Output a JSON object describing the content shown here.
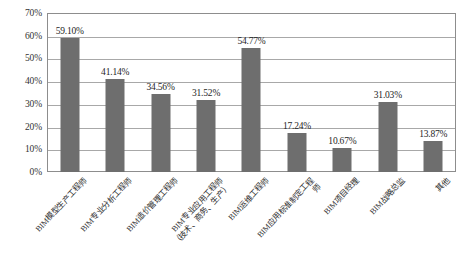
{
  "chart_data": {
    "type": "bar",
    "title": "",
    "subtitle": "",
    "xlabel": "",
    "ylabel": "",
    "ylim": [
      0,
      70
    ],
    "ytick_step": 10,
    "grid": true,
    "legend": false,
    "legend_position": "none",
    "value_unit": "%",
    "bar_color": "#6e6e6e",
    "frame_color": "#8d8d8d",
    "gridline_color": "#a8a8a8",
    "categories": [
      "BIM模型生产工程师",
      "BIM专业分析工程师",
      "BIM造价管理工程师",
      "BIM专业应用工程师（技术、商务、生产）",
      "BIM运维工程师",
      "BIM应用标准制定工程师",
      "BIM项目经理",
      "BIM战略总监",
      "其他"
    ],
    "values": [
      59.1,
      41.14,
      34.56,
      31.52,
      54.77,
      17.24,
      10.67,
      31.03,
      13.87
    ],
    "value_labels": [
      "59.10%",
      "41.14%",
      "34.56%",
      "31.52%",
      "54.77%",
      "17.24%",
      "10.67%",
      "31.03%",
      "13.87%"
    ],
    "ytick_labels": [
      "70%",
      "60%",
      "50%",
      "40%",
      "30%",
      "20%",
      "10%",
      "0%"
    ],
    "ytick_values": [
      70,
      60,
      50,
      40,
      30,
      20,
      10,
      0
    ]
  }
}
